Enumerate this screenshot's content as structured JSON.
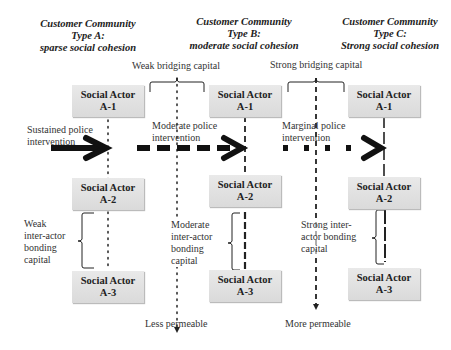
{
  "columns": [
    {
      "title_line1": "Customer Community",
      "title_line2": "Type A:",
      "title_line3": "sparse social cohesion",
      "line_style": "dotted",
      "actors": [
        {
          "name": "Social Actor",
          "id": "A-1"
        },
        {
          "name": "Social Actor",
          "id": "A-2"
        },
        {
          "name": "Social Actor",
          "id": "A-3"
        }
      ],
      "intervention": [
        "Sustained police",
        "intervention"
      ],
      "bonding": [
        "Weak",
        "inter-actor",
        "bonding",
        "capital"
      ]
    },
    {
      "title_line1": "Customer Community",
      "title_line2": "Type B:",
      "title_line3": "moderate social cohesion",
      "line_style": "dashed",
      "actors": [
        {
          "name": "Social Actor",
          "id": "A-1"
        },
        {
          "name": "Social Actor",
          "id": "A-2"
        },
        {
          "name": "Social Actor",
          "id": "A-3"
        }
      ],
      "intervention": [
        "Moderate police",
        "intervention"
      ],
      "bonding": [
        "Moderate",
        "inter-actor",
        "bonding",
        "capital"
      ]
    },
    {
      "title_line1": "Customer Community",
      "title_line2": "Type C:",
      "title_line3": "Strong social cohesion",
      "line_style": "long-dashed",
      "actors": [
        {
          "name": "Social Actor",
          "id": "A-1"
        },
        {
          "name": "Social Actor",
          "id": "A-2"
        },
        {
          "name": "Social Actor",
          "id": "A-3"
        }
      ],
      "intervention": [
        "Marginal police",
        "intervention"
      ],
      "bonding": [
        "Strong inter-",
        "actor bonding",
        "capital"
      ]
    }
  ],
  "bridging": [
    {
      "label": "Weak bridging capital",
      "bottom_label": "Less permeable",
      "line_style": "dotted"
    },
    {
      "label": "Strong bridging capital",
      "bottom_label": "More permeable",
      "line_style": "dashed"
    }
  ]
}
